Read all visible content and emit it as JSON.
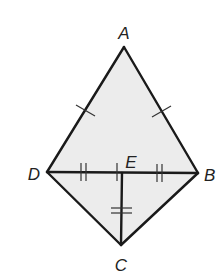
{
  "diagram": {
    "fill_color": "#ececec",
    "line_color": "#1a1a1a",
    "points": {
      "A": {
        "label": "A",
        "x": 124,
        "y": 47
      },
      "B": {
        "label": "B",
        "x": 198,
        "y": 173
      },
      "C": {
        "label": "C",
        "x": 121,
        "y": 245
      },
      "D": {
        "label": "D",
        "x": 47,
        "y": 172
      },
      "E": {
        "label": "E",
        "x": 122,
        "y": 173
      }
    },
    "segments": [
      "AB",
      "AD",
      "BC",
      "CD",
      "DB",
      "EC"
    ],
    "congruence_marks": [
      {
        "segments": [
          "AD",
          "AB"
        ],
        "ticks": 1
      },
      {
        "segments": [
          "DE",
          "EB",
          "EC"
        ],
        "ticks": 2
      }
    ],
    "labels": {
      "A": "A",
      "B": "B",
      "C": "C",
      "D": "D",
      "E": "E"
    }
  }
}
